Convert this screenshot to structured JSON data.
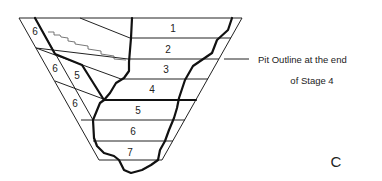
{
  "figure": {
    "panel_label": "C",
    "annotation": {
      "line1": "Pit Outline at the end",
      "line2": "of Stage 4"
    },
    "stages_center": [
      {
        "label": "1",
        "x": 173,
        "y": 32
      },
      {
        "label": "2",
        "x": 168,
        "y": 53
      },
      {
        "label": "3",
        "x": 166,
        "y": 73
      },
      {
        "label": "4",
        "x": 152,
        "y": 93
      },
      {
        "label": "5",
        "x": 138,
        "y": 114
      },
      {
        "label": "6",
        "x": 133,
        "y": 135
      },
      {
        "label": "7",
        "x": 130,
        "y": 156
      }
    ],
    "stages_left": [
      {
        "label": "6",
        "x": 35,
        "y": 35
      },
      {
        "label": "6",
        "x": 55,
        "y": 72
      },
      {
        "label": "5",
        "x": 77,
        "y": 79
      },
      {
        "label": "6",
        "x": 75,
        "y": 107
      }
    ]
  }
}
